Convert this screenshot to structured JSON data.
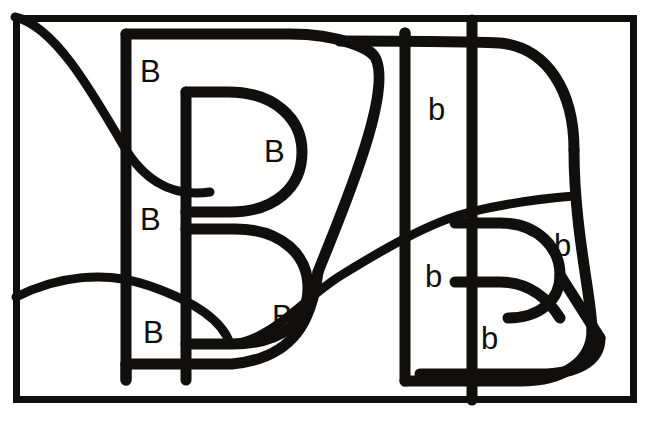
{
  "figure": {
    "type": "line-drawing",
    "stroke_color": "#100f0d",
    "background_color": "#ffffff",
    "border": {
      "x": 13,
      "y": 15,
      "width": 624,
      "height": 387
    },
    "canvas": {
      "width": 651,
      "height": 425
    }
  },
  "labels": [
    {
      "id": "b1",
      "text": "B",
      "case": "upper",
      "x": 140,
      "y": 56
    },
    {
      "id": "b2",
      "text": "B",
      "case": "upper",
      "x": 264,
      "y": 136
    },
    {
      "id": "b3",
      "text": "B",
      "case": "upper",
      "x": 140,
      "y": 204
    },
    {
      "id": "b4",
      "text": "B",
      "case": "upper",
      "x": 272,
      "y": 301
    },
    {
      "id": "b5",
      "text": "B",
      "case": "upper",
      "x": 143,
      "y": 317
    },
    {
      "id": "b6",
      "text": "b",
      "case": "lower",
      "x": 428,
      "y": 94
    },
    {
      "id": "b7",
      "text": "b",
      "case": "lower",
      "x": 554,
      "y": 230
    },
    {
      "id": "b8",
      "text": "b",
      "case": "lower",
      "x": 425,
      "y": 261
    },
    {
      "id": "b9",
      "text": "b",
      "case": "lower",
      "x": 481,
      "y": 323
    }
  ],
  "counts": {
    "uppercase_B": 5,
    "lowercase_b": 4,
    "total_regions": 9
  }
}
